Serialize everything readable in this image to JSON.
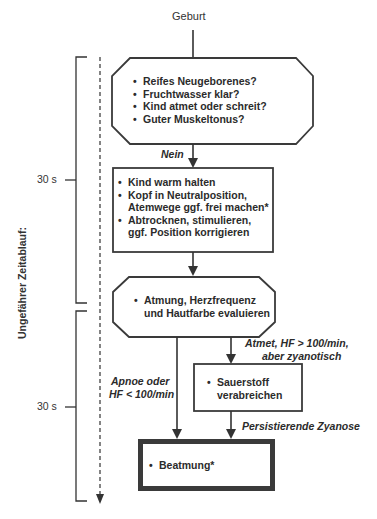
{
  "diagram": {
    "start_label": "Geburt",
    "timeline": {
      "axis_label": "Ungefährer Zeitablauf:",
      "ticks": [
        {
          "label": "30 s"
        },
        {
          "label": "30 s"
        }
      ]
    },
    "nodes": {
      "assessment": {
        "shape": "octagon",
        "items": [
          "Reifes Neugeborenes?",
          "Fruchtwasser klar?",
          "Kind atmet oder schreit?",
          "Guter Muskeltonus?"
        ]
      },
      "initial_steps": {
        "shape": "rectangle",
        "items": [
          "Kind warm halten",
          "Kopf in Neutralposition,",
          "Atemwege ggf. frei machen*",
          "Abtrocknen, stimulieren,",
          "ggf. Position korrigieren"
        ]
      },
      "evaluate": {
        "shape": "octagon",
        "line1": "Atmung, Herzfrequenz",
        "line2": "und Hautfarbe evaluieren"
      },
      "oxygen": {
        "shape": "rectangle",
        "line1": "Sauerstoff",
        "line2": "verabreichen"
      },
      "ventilation": {
        "shape": "rectangle-thick",
        "label": "Beatmung*"
      }
    },
    "edges": {
      "no_label": "Nein",
      "cyanotic_line1": "Atmet, HF > 100/min,",
      "cyanotic_line2": "aber zyanotisch",
      "apnea_line1": "Apnoe oder",
      "apnea_line2": "HF < 100/min",
      "persistent_label": "Persistierende Zyanose"
    },
    "colors": {
      "stroke": "#333333",
      "thick_border": "#3a3a3a"
    }
  }
}
